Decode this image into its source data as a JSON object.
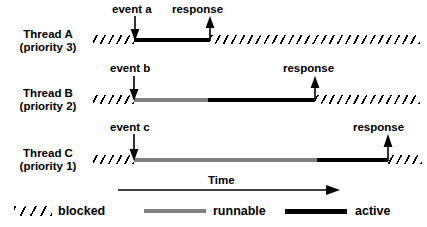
{
  "diagram": {
    "title_text": "",
    "colors": {
      "active": "#000000",
      "runnable": "#808080",
      "blocked": "#000000",
      "background": "#ffffff"
    },
    "threads": [
      {
        "id": "thread-a",
        "name": "Thread A",
        "priority": "(priority 3)",
        "event_label": "event a",
        "response_label": "response",
        "segments": [
          {
            "state": "blocked",
            "from": 93,
            "to": 134
          },
          {
            "state": "active",
            "from": 134,
            "to": 210
          },
          {
            "state": "blocked",
            "from": 210,
            "to": 420
          }
        ]
      },
      {
        "id": "thread-b",
        "name": "Thread B",
        "priority": "(priority 2)",
        "event_label": "event b",
        "response_label": "response",
        "segments": [
          {
            "state": "blocked",
            "from": 93,
            "to": 134
          },
          {
            "state": "runnable",
            "from": 134,
            "to": 208
          },
          {
            "state": "active",
            "from": 208,
            "to": 315
          },
          {
            "state": "blocked",
            "from": 315,
            "to": 420
          }
        ]
      },
      {
        "id": "thread-c",
        "name": "Thread C",
        "priority": "(priority 1)",
        "event_label": "event c",
        "response_label": "response",
        "segments": [
          {
            "state": "blocked",
            "from": 93,
            "to": 134
          },
          {
            "state": "runnable",
            "from": 134,
            "to": 317
          },
          {
            "state": "active",
            "from": 317,
            "to": 388
          },
          {
            "state": "blocked",
            "from": 388,
            "to": 420
          }
        ]
      }
    ],
    "time_axis": {
      "label": "Time",
      "direction": "left-to-right"
    },
    "legend": [
      {
        "key": "blocked",
        "label": "blocked",
        "swatch": "hatched-diagonal"
      },
      {
        "key": "runnable",
        "label": "runnable",
        "swatch": "gray-line"
      },
      {
        "key": "active",
        "label": "active",
        "swatch": "black-line"
      }
    ]
  }
}
